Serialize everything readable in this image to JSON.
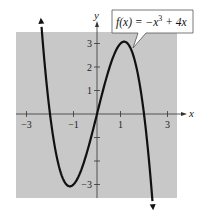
{
  "chart_data": {
    "type": "line",
    "title": "",
    "function_label": "f(x) = −x³ + 4x",
    "function_label_parts": {
      "lhs": "f(x) = −x",
      "exponent": "3",
      "rhs": " + 4x"
    },
    "xlabel": "x",
    "ylabel": "y",
    "xlim": [
      -3.45,
      3.4
    ],
    "ylim": [
      -3.6,
      3.5
    ],
    "x_ticks": [
      -3,
      -2,
      -1,
      1,
      2,
      3
    ],
    "x_tick_labels": [
      {
        "value": -3,
        "label": "−3"
      },
      {
        "value": -1,
        "label": "−1"
      },
      {
        "value": 1,
        "label": "1"
      },
      {
        "value": 3,
        "label": "3"
      }
    ],
    "y_ticks": [
      -3,
      -2,
      -1,
      1,
      2,
      3
    ],
    "y_tick_labels": [
      {
        "value": 3,
        "label": "3"
      },
      {
        "value": 2,
        "label": "2"
      },
      {
        "value": 1,
        "label": "1"
      },
      {
        "value": -3,
        "label": "−3"
      }
    ],
    "grid": false,
    "background": "#c8c8c8",
    "curve_color": "#111111",
    "series": [
      {
        "name": "f(x) = -x^3 + 4x",
        "domain": [
          -2.36,
          2.36
        ],
        "arrows": "both",
        "x": [
          -2.36,
          -2,
          -1.5,
          -1.155,
          -1,
          -0.5,
          0,
          0.5,
          1,
          1.155,
          1.5,
          2,
          2.36
        ],
        "y": [
          3.7,
          0,
          -2.63,
          -3.08,
          -3,
          -1.88,
          0,
          1.88,
          3,
          3.08,
          2.63,
          0,
          -3.7
        ]
      }
    ],
    "key_points": {
      "zeros": [
        -2,
        0,
        2
      ],
      "local_max": [
        1.155,
        3.08
      ],
      "local_min": [
        -1.155,
        -3.08
      ]
    }
  }
}
